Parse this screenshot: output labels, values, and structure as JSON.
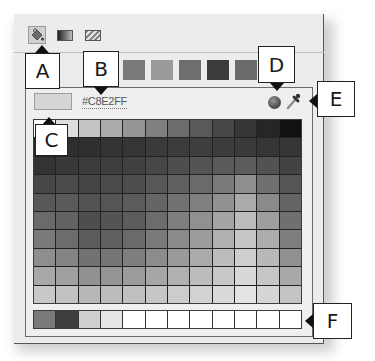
{
  "tabs": [
    {
      "name": "solid-color",
      "icon": "paint-bucket-icon",
      "active": true
    },
    {
      "name": "gradient",
      "icon": "gradient-icon",
      "active": false
    },
    {
      "name": "pattern",
      "icon": "pattern-icon",
      "active": false
    }
  ],
  "presets": [
    "#5c5c5c",
    "#7a7a7a",
    "#9a9a9a",
    "#6e6e6e",
    "#3c3c3c",
    "#6a6a6a",
    "#4a4a4a"
  ],
  "current_color": {
    "swatch": "#d5d5d5",
    "hex": "#C8E2FF"
  },
  "icons": {
    "color_wheel": "color-sphere-icon",
    "eyedropper": "eyedropper-icon"
  },
  "grid": {
    "columns": 12,
    "rows": [
      [
        "#ffffff",
        "#dedede",
        "#c4c4c4",
        "#aaaaaa",
        "#959595",
        "#808080",
        "#6c6c6c",
        "#595959",
        "#474747",
        "#363636",
        "#262626",
        "#111111"
      ],
      [
        "#262626",
        "#2e2e2e",
        "#303030",
        "#333333",
        "#353535",
        "#3a3a3a",
        "#3c3c3c",
        "#3e3e3e",
        "#3c3c3c",
        "#3a3a3a",
        "#353535",
        "#363636"
      ],
      [
        "#333333",
        "#383838",
        "#3b3b3b",
        "#3e3e3e",
        "#414141",
        "#474747",
        "#4e4e4e",
        "#545454",
        "#5a5a5a",
        "#5c5c5c",
        "#525252",
        "#434343"
      ],
      [
        "#474747",
        "#4a4a4a",
        "#454545",
        "#4a4a4a",
        "#4e4e4e",
        "#575757",
        "#606060",
        "#6a6a6a",
        "#7a7a7a",
        "#8e8e8e",
        "#707070",
        "#555555"
      ],
      [
        "#585858",
        "#5a5a5a",
        "#535353",
        "#555555",
        "#5b5b5b",
        "#656565",
        "#727272",
        "#808080",
        "#929292",
        "#aaaaaa",
        "#8a8a8a",
        "#646464"
      ],
      [
        "#6a6a6a",
        "#626262",
        "#4e4e4e",
        "#545454",
        "#5c5c5c",
        "#6c6c6c",
        "#7e7e7e",
        "#909090",
        "#a5a5a5",
        "#bcbcbc",
        "#9e9e9e",
        "#707070"
      ],
      [
        "#7a7a7a",
        "#6c6c6c",
        "#5c5c5c",
        "#606060",
        "#6a6a6a",
        "#7a7a7a",
        "#8a8a8a",
        "#9c9c9c",
        "#b0b0b0",
        "#c6c6c6",
        "#acacac",
        "#7e7e7e"
      ],
      [
        "#8e8e8e",
        "#848484",
        "#727272",
        "#767676",
        "#7e7e7e",
        "#8c8c8c",
        "#9a9a9a",
        "#aaaaaa",
        "#bcbcbc",
        "#cecece",
        "#b8b8b8",
        "#909090"
      ],
      [
        "#a8a8a8",
        "#a0a0a0",
        "#929292",
        "#959595",
        "#9c9c9c",
        "#a6a6a6",
        "#b0b0b0",
        "#bcbcbc",
        "#c8c8c8",
        "#d8d8d8",
        "#c6c6c6",
        "#a8a8a8"
      ],
      [
        "#c8c8c8",
        "#c2c2c2",
        "#b8b8b8",
        "#bcbcbc",
        "#c0c0c0",
        "#c6c6c6",
        "#cccccc",
        "#d2d2d2",
        "#dadada",
        "#e4e4e4",
        "#d6d6d6",
        "#c4c4c4"
      ]
    ]
  },
  "recent": [
    "#7a7a7a",
    "#3e3e3e",
    "#cfcfcf",
    "#e6e6e6",
    "#ffffff",
    "#ffffff",
    "#ffffff",
    "#ffffff",
    "#ffffff",
    "#ffffff",
    "#ffffff",
    "#ffffff"
  ],
  "callouts": {
    "a": "A",
    "b": "B",
    "c": "C",
    "d": "D",
    "e": "E",
    "f": "F"
  }
}
